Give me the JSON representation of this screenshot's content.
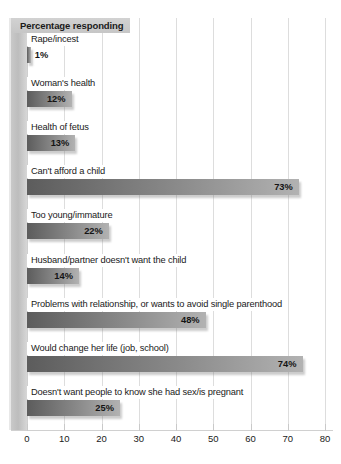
{
  "chart_data": {
    "type": "bar",
    "orientation": "horizontal",
    "title": "Percentage responding",
    "xlabel": "",
    "ylabel": "",
    "xlim": [
      0,
      80
    ],
    "xticks": [
      0,
      10,
      20,
      30,
      40,
      50,
      60,
      70,
      80
    ],
    "grid": true,
    "legend": false,
    "categories": [
      "Rape/incest",
      "Woman's health",
      "Health of fetus",
      "Can't afford a child",
      "Too young/immature",
      "Husband/partner doesn't want the child",
      "Problems with relationship, or wants to avoid single parenthood",
      "Would change her life (job, school)",
      "Doesn't want people to know she had sex/is pregnant"
    ],
    "values": [
      1,
      12,
      13,
      73,
      22,
      14,
      48,
      74,
      25
    ],
    "data_labels": [
      "1%",
      "12%",
      "13%",
      "73%",
      "22%",
      "14%",
      "48%",
      "74%",
      "25%"
    ],
    "bar_color_dark": "#5c5c5c",
    "bar_color_light": "#b2b2b2",
    "title_band_color": "#c9c9c9",
    "gridline_color": "#dddddd"
  },
  "axis": {
    "tick_labels": [
      "0",
      "10",
      "20",
      "30",
      "40",
      "50",
      "60",
      "70",
      "80"
    ]
  },
  "caption": {
    "text": ""
  }
}
